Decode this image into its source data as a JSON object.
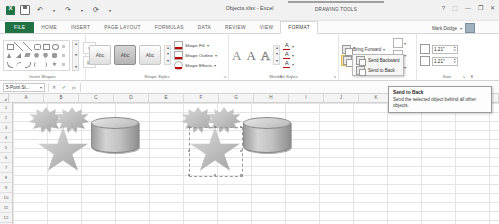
{
  "titlebar": {
    "doc_title": "Objects.xlsx - Excel",
    "qat": [
      {
        "name": "excel-logo",
        "glyph": "X"
      },
      {
        "name": "save",
        "glyph": "⬜"
      },
      {
        "name": "undo",
        "glyph": "↶"
      },
      {
        "name": "redo",
        "glyph": "↷"
      },
      {
        "name": "repeat",
        "glyph": "⟳"
      },
      {
        "name": "customize",
        "glyph": "▾"
      }
    ],
    "window_controls": [
      {
        "name": "help",
        "glyph": "?"
      },
      {
        "name": "ribbon-display-options",
        "glyph": "⬚"
      },
      {
        "name": "minimize",
        "glyph": "—"
      },
      {
        "name": "restore",
        "glyph": "❐"
      },
      {
        "name": "close",
        "glyph": "✕"
      }
    ]
  },
  "context_tab": {
    "label": "DRAWING TOOLS"
  },
  "tabs": [
    {
      "label": "FILE",
      "state": "file"
    },
    {
      "label": "HOME",
      "state": "normal"
    },
    {
      "label": "INSERT",
      "state": "normal"
    },
    {
      "label": "PAGE LAYOUT",
      "state": "normal"
    },
    {
      "label": "FORMULAS",
      "state": "normal"
    },
    {
      "label": "DATA",
      "state": "normal"
    },
    {
      "label": "REVIEW",
      "state": "normal"
    },
    {
      "label": "VIEW",
      "state": "normal"
    },
    {
      "label": "FORMAT",
      "state": "active"
    }
  ],
  "user": {
    "name": "Mark Dodge",
    "caret": "▾"
  },
  "ribbon": {
    "groups": [
      {
        "name": "Insert Shapes"
      },
      {
        "name": "Shape Styles"
      },
      {
        "name": "WordArt Styles"
      },
      {
        "name": "Arrange"
      },
      {
        "name": "Size"
      }
    ],
    "shape_styles": {
      "preview_label": "Abc",
      "fill_label": "Shape Fill",
      "outline_label": "Shape Outline",
      "effects_label": "Shape Effects",
      "caret": "▾"
    },
    "wordart": {
      "letters": [
        "A",
        "A",
        "A"
      ],
      "text_fill_label": "A",
      "text_outline_label": "A",
      "text_effects_label": "A",
      "caret": "▾"
    },
    "arrange": {
      "bring_forward": "Bring Forward",
      "send_backward": "Send Backward",
      "selection_pane": "Selection Pane",
      "align": "Align",
      "group": "Group",
      "rotate": "Rotate",
      "caret": "▾"
    },
    "size": {
      "height_value": "1.21\"",
      "width_value": "1.21\"",
      "height_icon": "shape-height-icon",
      "width_icon": "shape-width-icon"
    },
    "dialog_launcher": "↘",
    "collapse_ribbon": "∧"
  },
  "menu": {
    "items": [
      {
        "label": "Send Backward",
        "accel": "B"
      },
      {
        "label": "Send to Back",
        "accel": "k"
      }
    ]
  },
  "formula_bar": {
    "name_box_value": "5-Point St...",
    "name_box_caret": "▾",
    "cancel": "✕",
    "enter": "✓",
    "insert_function": "fx",
    "input_value": ""
  },
  "grid": {
    "columns": [
      "A",
      "B",
      "C",
      "D",
      "E",
      "F",
      "G",
      "H",
      "I",
      "J",
      "K",
      "L",
      "M",
      "N"
    ],
    "rows": [
      "1",
      "2",
      "3",
      "4",
      "5",
      "6",
      "7",
      "8",
      "9",
      "10",
      "11",
      "12",
      "13",
      "14"
    ]
  },
  "tooltip": {
    "title": "Send to Back",
    "body": "Send the selected object behind all other objects."
  }
}
